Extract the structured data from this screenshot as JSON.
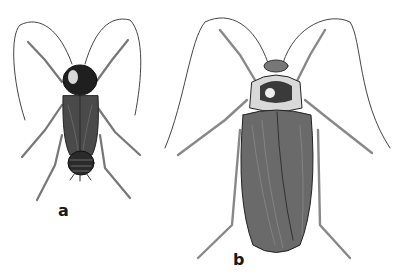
{
  "figure": {
    "specimens": [
      {
        "label": "a",
        "form": "smaller cockroach with dark pronotum and short wings, segmented abdomen visible"
      },
      {
        "label": "b",
        "form": "larger cockroach with light-edged pronotum and long veined wings"
      }
    ]
  },
  "colors": {
    "background": "#ffffff",
    "ink": "#1a1a1a",
    "body_dark": "#2a2a2a",
    "body_mid": "#555555",
    "leg": "#888888"
  }
}
